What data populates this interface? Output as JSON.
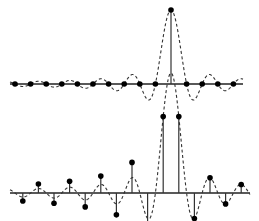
{
  "chart_data": [
    {
      "type": "stem",
      "title": "",
      "description": "Sinc function (dashed) sampled exactly at its peak and zero crossings: single non-zero sample",
      "curve": "sinc",
      "x_samples": [
        -10,
        -9,
        -8,
        -7,
        -6,
        -5,
        -4,
        -3,
        -2,
        -1,
        0,
        1,
        2,
        3,
        4
      ],
      "values": [
        0,
        0,
        0,
        0,
        0,
        0,
        0,
        0,
        0,
        0,
        1,
        0,
        0,
        0,
        0
      ],
      "peak_index": 10,
      "grid": false,
      "legend": null
    },
    {
      "type": "stem",
      "title": "",
      "description": "Same sinc function (dashed) sampled with a half-sample offset: samples at sinc lobes",
      "curve": "sinc",
      "x_samples": [
        -9.5,
        -8.5,
        -7.5,
        -6.5,
        -5.5,
        -4.5,
        -3.5,
        -2.5,
        -1.5,
        -0.5,
        0.5,
        1.5,
        2.5,
        3.5,
        4.5
      ],
      "values": [
        -0.067,
        0.075,
        -0.085,
        0.098,
        -0.116,
        0.141,
        -0.182,
        0.255,
        -0.424,
        0.637,
        0.637,
        -0.212,
        0.127,
        -0.091,
        0.071
      ],
      "grid": false,
      "legend": null
    }
  ],
  "layout": {
    "top": {
      "axis_y": 84,
      "x0": 10,
      "x1": 243,
      "amp": 74,
      "center_x": 171,
      "spacing": 15.6
    },
    "bottom": {
      "axis_y": 193,
      "x0": 10,
      "x1": 250,
      "amp": 120,
      "center_x": 171,
      "spacing": 15.6
    }
  },
  "colors": {
    "line": "#222222",
    "dot": "#000000",
    "background": "#ffffff"
  }
}
